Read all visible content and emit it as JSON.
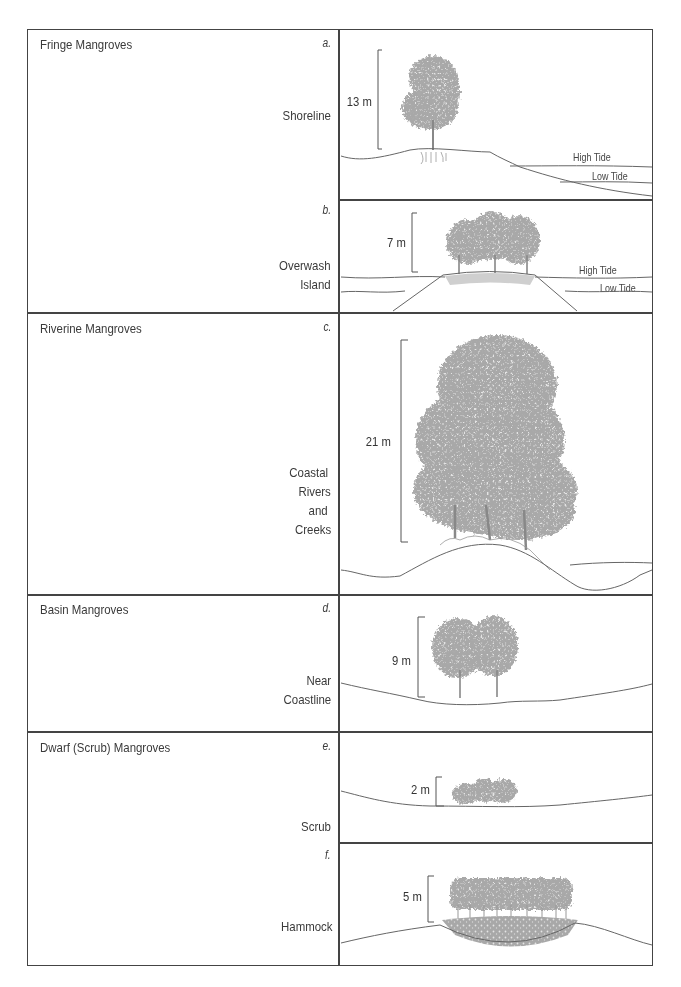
{
  "figure": {
    "categories": [
      {
        "title": "Fringe Mangroves",
        "panels": [
          {
            "letter": "a.",
            "setting": [
              "Shoreline"
            ],
            "height_label": "13 m",
            "height_m": 13,
            "tide_labels": [
              "High Tide",
              "Low Tide"
            ]
          },
          {
            "letter": "b.",
            "setting": [
              "Overwash",
              "Island"
            ],
            "height_label": "7 m",
            "height_m": 7,
            "tide_labels": [
              "High Tide",
              "Low Tide"
            ]
          }
        ]
      },
      {
        "title": "Riverine Mangroves",
        "panels": [
          {
            "letter": "c.",
            "setting": [
              "Coastal",
              "Rivers",
              "and",
              "Creeks"
            ],
            "height_label": "21 m",
            "height_m": 21
          }
        ]
      },
      {
        "title": "Basin Mangroves",
        "panels": [
          {
            "letter": "d.",
            "setting": [
              "Near",
              "Coastline"
            ],
            "height_label": "9 m",
            "height_m": 9
          }
        ]
      },
      {
        "title": "Dwarf (Scrub) Mangroves",
        "panels": [
          {
            "letter": "e.",
            "setting": [
              "Scrub"
            ],
            "height_label": "2 m",
            "height_m": 2
          },
          {
            "letter": "f.",
            "setting": [
              "Hammock"
            ],
            "height_label": "5 m",
            "height_m": 5
          }
        ]
      }
    ]
  },
  "colors": {
    "border": "#444444",
    "text": "#3a3a3a",
    "tree": "#9a9a9a",
    "line": "#6a6a6a"
  }
}
